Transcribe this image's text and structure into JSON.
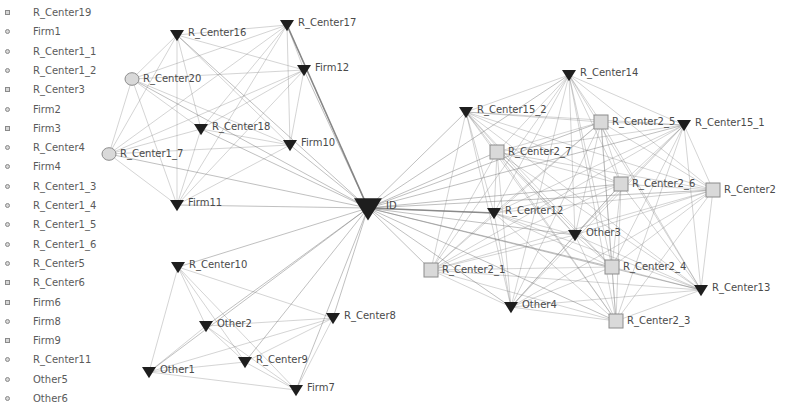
{
  "isolated_nodes": [
    {
      "label": "R_Center19",
      "shape": "square"
    },
    {
      "label": "Firm1",
      "shape": "circle"
    },
    {
      "label": "R_Center1_1",
      "shape": "circle"
    },
    {
      "label": "R_Center1_2",
      "shape": "circle"
    },
    {
      "label": "R_Center3",
      "shape": "square"
    },
    {
      "label": "Firm2",
      "shape": "circle"
    },
    {
      "label": "Firm3",
      "shape": "square"
    },
    {
      "label": "R_Center4",
      "shape": "circle"
    },
    {
      "label": "Firm4",
      "shape": "circle"
    },
    {
      "label": "R_Center1_3",
      "shape": "circle"
    },
    {
      "label": "R_Center1_4",
      "shape": "circle"
    },
    {
      "label": "R_Center1_5",
      "shape": "circle"
    },
    {
      "label": "R_Center1_6",
      "shape": "circle"
    },
    {
      "label": "R_Center5",
      "shape": "circle"
    },
    {
      "label": "R_Center6",
      "shape": "square"
    },
    {
      "label": "Firm6",
      "shape": "square"
    },
    {
      "label": "Firm8",
      "shape": "circle"
    },
    {
      "label": "Firm9",
      "shape": "square"
    },
    {
      "label": "R_Center11",
      "shape": "circle"
    },
    {
      "label": "Other5",
      "shape": "circle"
    },
    {
      "label": "Other6",
      "shape": "circle"
    }
  ],
  "colors": {
    "triangle_fill": "#1e1e1e",
    "square_fill": "#d9d9d9",
    "circle_fill": "#d9d9d9",
    "node_stroke": "#8c8c8c",
    "edge": "#7a7a7a",
    "label": "#4a4a4a"
  },
  "nodes": [
    {
      "id": "ID",
      "label": "ID",
      "shape": "triangle",
      "size": 14,
      "x": 368,
      "y": 208
    },
    {
      "id": "R_Center16",
      "label": "R_Center16",
      "shape": "triangle",
      "size": 7,
      "x": 177,
      "y": 35
    },
    {
      "id": "R_Center17",
      "label": "R_Center17",
      "shape": "triangle",
      "size": 7,
      "x": 287,
      "y": 25
    },
    {
      "id": "Firm12",
      "label": "Firm12",
      "shape": "triangle",
      "size": 7,
      "x": 304,
      "y": 70
    },
    {
      "id": "R_Center20",
      "label": "R_Center20",
      "shape": "circle",
      "size": 7,
      "x": 132,
      "y": 79
    },
    {
      "id": "R_Center18",
      "label": "R_Center18",
      "shape": "triangle",
      "size": 7,
      "x": 201,
      "y": 129
    },
    {
      "id": "Firm10",
      "label": "Firm10",
      "shape": "triangle",
      "size": 7,
      "x": 290,
      "y": 145
    },
    {
      "id": "R_Center1_7",
      "label": "R_Center1_7",
      "shape": "circle",
      "size": 7,
      "x": 109,
      "y": 154
    },
    {
      "id": "Firm11",
      "label": "Firm11",
      "shape": "triangle",
      "size": 7,
      "x": 177,
      "y": 205
    },
    {
      "id": "R_Center14",
      "label": "R_Center14",
      "shape": "triangle",
      "size": 7,
      "x": 569,
      "y": 75
    },
    {
      "id": "R_Center15_2",
      "label": "R_Center15_2",
      "shape": "triangle",
      "size": 7,
      "x": 466,
      "y": 112
    },
    {
      "id": "R_Center2_5",
      "label": "R_Center2_5",
      "shape": "square",
      "size": 7,
      "x": 601,
      "y": 122
    },
    {
      "id": "R_Center15_1",
      "label": "R_Center15_1",
      "shape": "triangle",
      "size": 7,
      "x": 684,
      "y": 125
    },
    {
      "id": "R_Center2_7",
      "label": "R_Center2_7",
      "shape": "square",
      "size": 7,
      "x": 497,
      "y": 152
    },
    {
      "id": "R_Center2_6",
      "label": "R_Center2_6",
      "shape": "square",
      "size": 7,
      "x": 621,
      "y": 184
    },
    {
      "id": "R_Center2",
      "label": "R_Center2",
      "shape": "square",
      "size": 7,
      "x": 713,
      "y": 190
    },
    {
      "id": "R_Center12",
      "label": "R_Center12",
      "shape": "triangle",
      "size": 7,
      "x": 494,
      "y": 213
    },
    {
      "id": "Other3",
      "label": "Other3",
      "shape": "triangle",
      "size": 7,
      "x": 575,
      "y": 235
    },
    {
      "id": "R_Center2_1",
      "label": "R_Center2_1",
      "shape": "square",
      "size": 7,
      "x": 431,
      "y": 270
    },
    {
      "id": "R_Center2_4",
      "label": "R_Center2_4",
      "shape": "square",
      "size": 7,
      "x": 612,
      "y": 267
    },
    {
      "id": "R_Center13",
      "label": "R_Center13",
      "shape": "triangle",
      "size": 7,
      "x": 701,
      "y": 290
    },
    {
      "id": "Other4",
      "label": "Other4",
      "shape": "triangle",
      "size": 7,
      "x": 511,
      "y": 307
    },
    {
      "id": "R_Center2_3",
      "label": "R_Center2_3",
      "shape": "square",
      "size": 7,
      "x": 616,
      "y": 321
    },
    {
      "id": "R_Center10",
      "label": "R_Center10",
      "shape": "triangle",
      "size": 7,
      "x": 178,
      "y": 267
    },
    {
      "id": "Other2",
      "label": "Other2",
      "shape": "triangle",
      "size": 7,
      "x": 206,
      "y": 326
    },
    {
      "id": "R_Center8",
      "label": "R_Center8",
      "shape": "triangle",
      "size": 7,
      "x": 333,
      "y": 318
    },
    {
      "id": "R_Center9",
      "label": "R_Center9",
      "shape": "triangle",
      "size": 7,
      "x": 245,
      "y": 362
    },
    {
      "id": "Other1",
      "label": "Other1",
      "shape": "triangle",
      "size": 7,
      "x": 149,
      "y": 372
    },
    {
      "id": "Firm7",
      "label": "Firm7",
      "shape": "triangle",
      "size": 7,
      "x": 296,
      "y": 390
    }
  ],
  "clusters": {
    "top_left": [
      "R_Center16",
      "R_Center17",
      "Firm12",
      "R_Center20",
      "R_Center18",
      "Firm10",
      "R_Center1_7",
      "Firm11"
    ],
    "right": [
      "R_Center14",
      "R_Center15_2",
      "R_Center2_5",
      "R_Center15_1",
      "R_Center2_7",
      "R_Center2_6",
      "R_Center2",
      "R_Center12",
      "Other3",
      "R_Center2_1",
      "R_Center2_4",
      "R_Center13",
      "Other4",
      "R_Center2_3"
    ],
    "bottom_left": [
      "R_Center10",
      "Other2",
      "R_Center8",
      "R_Center9",
      "Other1",
      "Firm7"
    ]
  },
  "hub": "ID"
}
